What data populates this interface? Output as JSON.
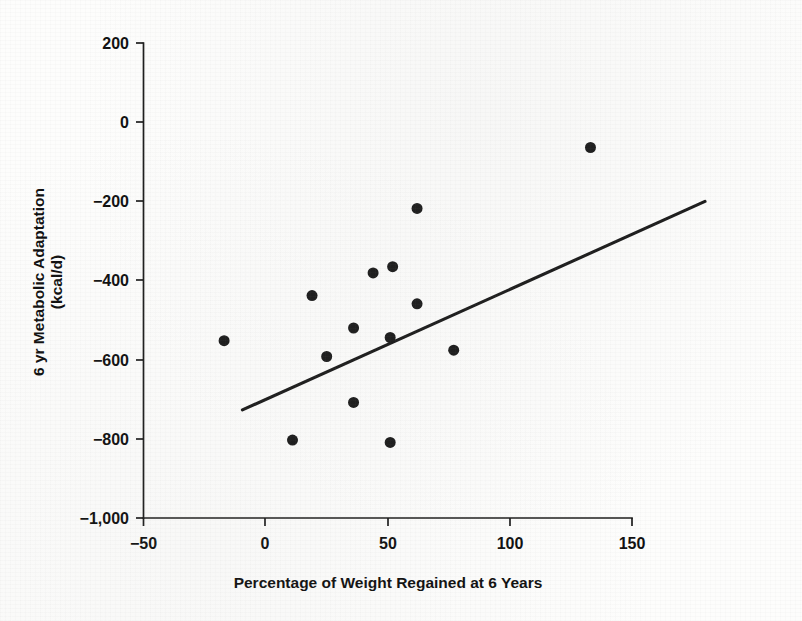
{
  "figure": {
    "background_color": "#fdfdfc",
    "ink_color": "#1a1a1a"
  },
  "chart_data": {
    "type": "scatter",
    "title": "",
    "subtitle": "",
    "xlabel": "Percentage of Weight Regained at 6 Years",
    "ylabel": "6 yr Metabolic Adaptation (kcal/d)",
    "ylabel_line1": "6 yr Metabolic Adaptation",
    "ylabel_line2": "(kcal/d)",
    "xlim": [
      -50,
      150
    ],
    "ylim": [
      -1000,
      200
    ],
    "xticks": [
      -50,
      0,
      50,
      100,
      150
    ],
    "xticklabels": [
      "−50",
      "0",
      "50",
      "100",
      "150"
    ],
    "yticks": [
      200,
      0,
      -200,
      -400,
      -600,
      -800,
      -1000
    ],
    "yticklabels": [
      "200",
      "0",
      "−200",
      "−400",
      "−600",
      "−800",
      "−1,000"
    ],
    "grid": false,
    "legend": false,
    "legend_position": "none",
    "marker": "filled-circle",
    "marker_color": "#1a1a1a",
    "marker_size_px": 11,
    "series": [
      {
        "name": "Participants",
        "x": [
          -17,
          11,
          19,
          25,
          36,
          36,
          44,
          51,
          51,
          52,
          62,
          62,
          77,
          133
        ],
        "y": [
          -552,
          -803,
          -438,
          -592,
          -520,
          -708,
          -381,
          -544,
          -809,
          -365,
          -218,
          -459,
          -576,
          -64
        ]
      }
    ],
    "points": [
      {
        "x": -17,
        "y": -552
      },
      {
        "x": 11,
        "y": -803
      },
      {
        "x": 19,
        "y": -438
      },
      {
        "x": 25,
        "y": -592
      },
      {
        "x": 36,
        "y": -520
      },
      {
        "x": 36,
        "y": -708
      },
      {
        "x": 44,
        "y": -381
      },
      {
        "x": 51,
        "y": -544
      },
      {
        "x": 51,
        "y": -809
      },
      {
        "x": 52,
        "y": -365
      },
      {
        "x": 62,
        "y": -218
      },
      {
        "x": 62,
        "y": -459
      },
      {
        "x": 77,
        "y": -576
      },
      {
        "x": 133,
        "y": -64
      }
    ],
    "trend_line": {
      "name": "Linear regression fit",
      "x_start": -9.5,
      "y_start": -727,
      "x_end": 180,
      "y_end": -200,
      "color": "#1a1a1a",
      "width_px": 3.1
    },
    "annotations": []
  }
}
